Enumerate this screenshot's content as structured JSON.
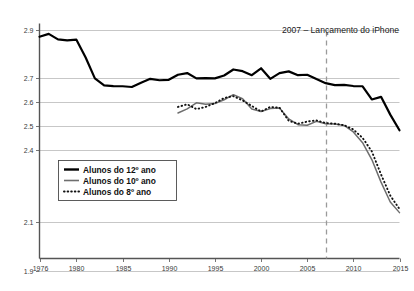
{
  "chart_data": {
    "type": "line",
    "title": "",
    "subtitle": "",
    "xlabel": "",
    "ylabel": "",
    "xlim": [
      1976,
      2015
    ],
    "ylim": [
      1.95,
      2.92
    ],
    "grid": true,
    "legend_position": "lower-left",
    "xticks": [
      1976,
      1980,
      1985,
      1990,
      1995,
      2000,
      2005,
      2010,
      2015
    ],
    "xtick_labels": [
      "1976",
      "1980",
      "1985",
      "1990",
      "1995",
      "2000",
      "2005",
      "2010",
      "2015"
    ],
    "yticks": [
      2.9,
      2.7,
      2.6,
      2.5,
      2.4,
      2.1,
      1.9
    ],
    "ytick_labels": [
      "2.9",
      "2.7",
      "2.6",
      "2.5",
      "2.4",
      "2.1",
      "1.9"
    ],
    "annotations": [
      {
        "name": "iphone-launch",
        "text": "2007 – Lançamento do iPhone",
        "x": 2007,
        "line": "dashed-vertical",
        "color": "#9a9a9a"
      }
    ],
    "series": [
      {
        "name": "Alunos do 12º ano",
        "style": "solid-thick-black",
        "color": "#000000",
        "x": [
          1976,
          1977,
          1978,
          1979,
          1980,
          1981,
          1982,
          1983,
          1984,
          1985,
          1986,
          1987,
          1988,
          1989,
          1990,
          1991,
          1992,
          1993,
          1994,
          1995,
          1996,
          1997,
          1998,
          1999,
          2000,
          2001,
          2002,
          2003,
          2004,
          2005,
          2006,
          2007,
          2008,
          2009,
          2010,
          2011,
          2012,
          2013,
          2014,
          2015
        ],
        "values": [
          2.873,
          2.885,
          2.862,
          2.858,
          2.861,
          2.787,
          2.7,
          2.671,
          2.668,
          2.667,
          2.664,
          2.682,
          2.698,
          2.692,
          2.694,
          2.715,
          2.722,
          2.7,
          2.701,
          2.7,
          2.712,
          2.737,
          2.73,
          2.713,
          2.742,
          2.698,
          2.722,
          2.729,
          2.713,
          2.715,
          2.697,
          2.68,
          2.672,
          2.673,
          2.668,
          2.667,
          2.612,
          2.623,
          2.549,
          2.484
        ]
      },
      {
        "name": "Alunos do 10º ano",
        "style": "solid-thin-gray",
        "color": "#6e6e6e",
        "x": [
          1991,
          1992,
          1993,
          1994,
          1995,
          1996,
          1997,
          1998,
          1999,
          2000,
          2001,
          2002,
          2003,
          2004,
          2005,
          2006,
          2007,
          2008,
          2009,
          2010,
          2011,
          2012,
          2013,
          2014,
          2015
        ],
        "values": [
          2.556,
          2.573,
          2.598,
          2.592,
          2.595,
          2.611,
          2.632,
          2.615,
          2.572,
          2.562,
          2.574,
          2.577,
          2.531,
          2.507,
          2.505,
          2.521,
          2.511,
          2.51,
          2.504,
          2.477,
          2.432,
          2.362,
          2.268,
          2.185,
          2.141
        ]
      },
      {
        "name": "Alunos do 8º ano",
        "style": "dotted-black",
        "color": "#111111",
        "x": [
          1991,
          1992,
          1993,
          1994,
          1995,
          1996,
          1997,
          1998,
          1999,
          2000,
          2001,
          2002,
          2003,
          2004,
          2005,
          2006,
          2007,
          2008,
          2009,
          2010,
          2011,
          2012,
          2013,
          2014,
          2015
        ],
        "values": [
          2.581,
          2.592,
          2.572,
          2.581,
          2.597,
          2.618,
          2.626,
          2.608,
          2.585,
          2.562,
          2.581,
          2.578,
          2.523,
          2.511,
          2.52,
          2.525,
          2.514,
          2.511,
          2.505,
          2.487,
          2.452,
          2.396,
          2.3,
          2.212,
          2.156
        ]
      }
    ],
    "legend_entries": [
      {
        "label": "Alunos do 12º ano",
        "style": "solid-thick-black"
      },
      {
        "label": "Alunos do 10º ano",
        "style": "solid-thin-gray"
      },
      {
        "label": "Alunos do 8º ano",
        "style": "dotted-black"
      }
    ]
  }
}
